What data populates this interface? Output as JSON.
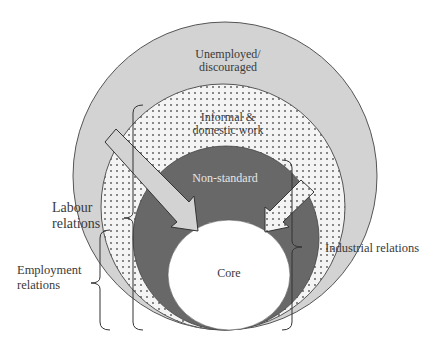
{
  "colors": {
    "outer_fill": "#d3d3d3",
    "informal_fill": "#f4f4f4",
    "dot_color": "#555555",
    "nonstandard_fill": "#686868",
    "core_fill": "#ffffff",
    "stroke": "#555555",
    "arrow_fill": "#d3d3d3"
  },
  "layers": [
    {
      "id": "outer",
      "label_lines": [
        "Unemployed/",
        "discouraged"
      ]
    },
    {
      "id": "informal",
      "label_lines": [
        "Informal &",
        "domestic work"
      ]
    },
    {
      "id": "nonstandard",
      "label_lines": [
        "Non-standard"
      ]
    },
    {
      "id": "core",
      "label_lines": [
        "Core"
      ]
    }
  ],
  "brackets": [
    {
      "id": "labour",
      "label_lines": [
        "Labour",
        "relations"
      ]
    },
    {
      "id": "employment",
      "label_lines": [
        "Employment",
        "relations"
      ]
    },
    {
      "id": "industrial",
      "label_lines": [
        "Industrial relations"
      ]
    }
  ],
  "arrows": [
    {
      "id": "left-arrow",
      "style": "solid"
    },
    {
      "id": "right-arrow",
      "style": "dotted"
    }
  ]
}
